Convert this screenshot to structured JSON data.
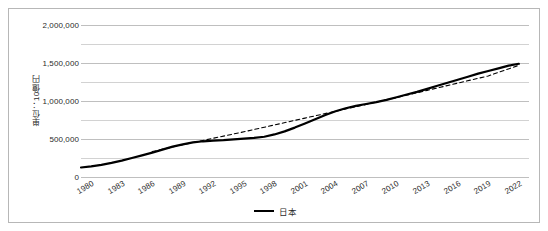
{
  "chart_data": {
    "type": "line",
    "title": "",
    "xlabel": "",
    "ylabel": "単位：10億円",
    "ylim": [
      0,
      2000000
    ],
    "ytick_labels": [
      "0",
      "500,000",
      "1,000,000",
      "1,500,000",
      "2,000,000"
    ],
    "ytick_values": [
      0,
      500000,
      1000000,
      1500000,
      2000000
    ],
    "minor_gridlines": true,
    "minor_tick_values": [
      250000,
      750000,
      1250000,
      1750000
    ],
    "grid": true,
    "legend_position": "bottom",
    "xtick_labels": [
      "1980",
      "1983",
      "1986",
      "1989",
      "1992",
      "1995",
      "1998",
      "2001",
      "2004",
      "2007",
      "2010",
      "2013",
      "2016",
      "2019",
      "2022"
    ],
    "xtick_values": [
      1980,
      1983,
      1986,
      1989,
      1992,
      1995,
      1998,
      2001,
      2004,
      2007,
      2010,
      2013,
      2016,
      2019,
      2022
    ],
    "xlim": [
      1980,
      2024
    ],
    "series": [
      {
        "name": "日本",
        "style": "solid",
        "color": "#000000",
        "x": [
          1980,
          1981,
          1982,
          1983,
          1984,
          1985,
          1986,
          1987,
          1988,
          1989,
          1990,
          1991,
          1992,
          1993,
          1994,
          1995,
          1996,
          1997,
          1998,
          1999,
          2000,
          2001,
          2002,
          2003,
          2004,
          2005,
          2006,
          2007,
          2008,
          2009,
          2010,
          2011,
          2012,
          2013,
          2014,
          2015,
          2016,
          2017,
          2018,
          2019,
          2020,
          2021,
          2022,
          2023
        ],
        "values": [
          125000,
          140000,
          160000,
          185000,
          215000,
          250000,
          285000,
          320000,
          360000,
          400000,
          430000,
          455000,
          470000,
          478000,
          485000,
          495000,
          505000,
          515000,
          530000,
          560000,
          600000,
          650000,
          705000,
          760000,
          815000,
          865000,
          905000,
          935000,
          960000,
          985000,
          1015000,
          1050000,
          1085000,
          1120000,
          1160000,
          1200000,
          1240000,
          1280000,
          1320000,
          1360000,
          1395000,
          1430000,
          1465000,
          1490000
        ]
      },
      {
        "name": "トレンド線",
        "style": "dashed",
        "color": "#000000",
        "x": [
          1987,
          1990,
          1993,
          1996,
          1999,
          2002,
          2005,
          2008,
          2011,
          2014,
          2017,
          2020,
          2023
        ],
        "values": [
          335000,
          425000,
          510000,
          595000,
          685000,
          775000,
          865000,
          955000,
          1045000,
          1140000,
          1235000,
          1330000,
          1470000
        ]
      }
    ],
    "legend_entries": [
      {
        "label": "日本",
        "color": "#000000",
        "style": "solid"
      }
    ]
  },
  "legend": {
    "label": "日本"
  },
  "axis": {
    "y_title": "単位：10億円"
  }
}
